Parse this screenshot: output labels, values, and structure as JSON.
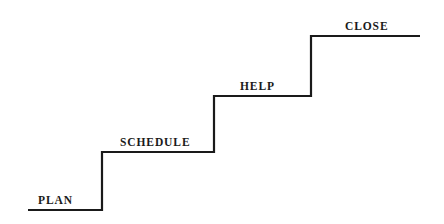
{
  "diagram": {
    "type": "staircase-process-diagram",
    "name": "Ascending step diagram",
    "background_color": "#ffffff",
    "line_color": "#1a1a1a",
    "line_width": 2.2,
    "canvas": {
      "width": 444,
      "height": 224
    },
    "steps": [
      {
        "id": "plan",
        "label": "PLAN",
        "order": 1,
        "tread": {
          "x1": 28,
          "x2": 102,
          "y": 210
        },
        "label_position": {
          "x": 38,
          "y": 195
        }
      },
      {
        "id": "schedule",
        "label": "SCHEDULE",
        "order": 2,
        "tread": {
          "x1": 102,
          "x2": 214,
          "y": 152
        },
        "label_position": {
          "x": 120,
          "y": 137
        }
      },
      {
        "id": "help",
        "label": "HELP",
        "order": 3,
        "tread": {
          "x1": 214,
          "x2": 311,
          "y": 96
        },
        "label_position": {
          "x": 240,
          "y": 81
        }
      },
      {
        "id": "close",
        "label": "CLOSE",
        "order": 4,
        "tread": {
          "x1": 311,
          "x2": 420,
          "y": 36
        },
        "label_position": {
          "x": 345,
          "y": 21
        }
      }
    ],
    "polyline_points": "28,210 102,210 102,152 214,152 214,96 311,96 311,36 420,36"
  }
}
